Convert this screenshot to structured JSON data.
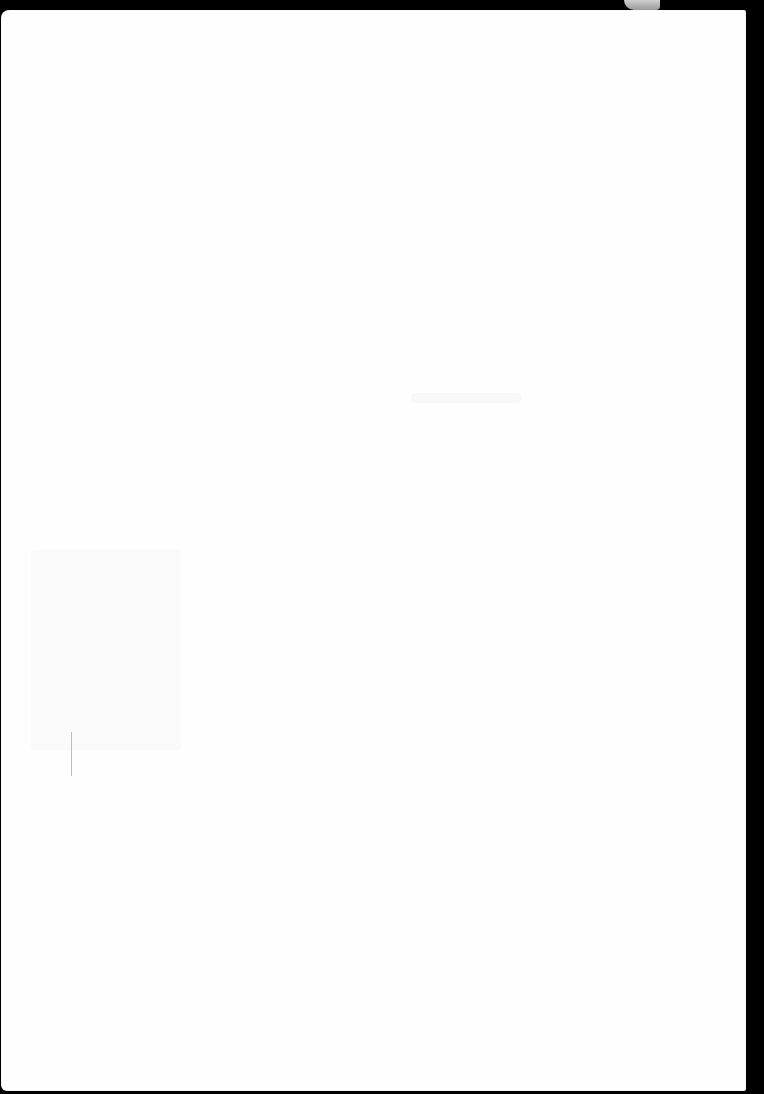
{
  "page": {
    "type": "scanned-blank-sheet",
    "background_color": "#000000",
    "paper_color": "#fefefe",
    "text_content": []
  },
  "marks": [
    {
      "kind": "bleed-through",
      "legible": false
    },
    {
      "kind": "bleed-through",
      "legible": false
    },
    {
      "kind": "pencil-line",
      "orientation": "vertical"
    }
  ]
}
